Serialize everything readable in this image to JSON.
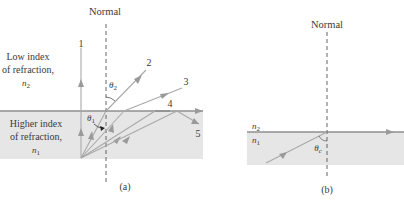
{
  "figure": {
    "panel_a": {
      "caption": "(a)",
      "normal_label": "Normal",
      "upper_medium": {
        "line1": "Low index",
        "line2": "of refraction,",
        "symbol": "n",
        "subscript": "2"
      },
      "lower_medium": {
        "line1": "Higher index",
        "line2": "of refraction,",
        "symbol": "n",
        "subscript": "1"
      },
      "angle_incident": {
        "symbol": "θ",
        "subscript": "1"
      },
      "angle_refracted": {
        "symbol": "θ",
        "subscript": "2"
      },
      "ray_labels": [
        "1",
        "2",
        "3",
        "4",
        "5"
      ]
    },
    "panel_b": {
      "caption": "(b)",
      "normal_label": "Normal",
      "upper_index": {
        "symbol": "n",
        "subscript": "2"
      },
      "lower_index": {
        "symbol": "n",
        "subscript": "1"
      },
      "critical_angle": {
        "symbol": "θ",
        "subscript": "c"
      }
    },
    "colors": {
      "dense_medium_fill": "#e6e6e6",
      "ray": "#a9a9a9",
      "interface": "#8f8f8f",
      "text": "#3a3a3a"
    }
  }
}
